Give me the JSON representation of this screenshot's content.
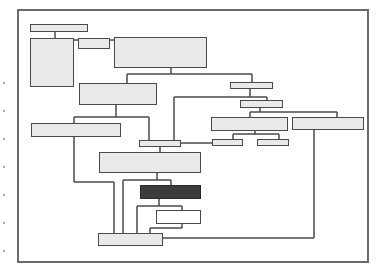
{
  "diagram": {
    "type": "hierarchical-block-diagram",
    "frame": {
      "x": 17,
      "y": 9,
      "w": 352,
      "h": 254,
      "color": "#6a6a6a"
    },
    "colors": {
      "light_fill": "#e9e9e9",
      "dark_fill": "#3c3c3c",
      "white_fill": "#ffffff",
      "stroke": "#4a4a4a"
    },
    "nodes": [
      {
        "id": "A",
        "x": 30,
        "y": 24,
        "w": 58,
        "h": 8,
        "style": "light"
      },
      {
        "id": "B",
        "x": 30,
        "y": 38,
        "w": 44,
        "h": 49,
        "style": "light"
      },
      {
        "id": "C",
        "x": 78,
        "y": 38,
        "w": 32,
        "h": 11,
        "style": "light"
      },
      {
        "id": "D",
        "x": 114,
        "y": 37,
        "w": 93,
        "h": 31,
        "style": "light"
      },
      {
        "id": "E",
        "x": 79,
        "y": 83,
        "w": 78,
        "h": 22,
        "style": "light"
      },
      {
        "id": "F",
        "x": 230,
        "y": 82,
        "w": 43,
        "h": 7,
        "style": "light"
      },
      {
        "id": "G",
        "x": 240,
        "y": 100,
        "w": 43,
        "h": 8,
        "style": "light"
      },
      {
        "id": "H",
        "x": 211,
        "y": 117,
        "w": 77,
        "h": 14,
        "style": "light"
      },
      {
        "id": "I",
        "x": 292,
        "y": 117,
        "w": 72,
        "h": 13,
        "style": "light"
      },
      {
        "id": "J",
        "x": 212,
        "y": 139,
        "w": 31,
        "h": 7,
        "style": "light"
      },
      {
        "id": "K",
        "x": 257,
        "y": 139,
        "w": 32,
        "h": 7,
        "style": "light"
      },
      {
        "id": "L",
        "x": 31,
        "y": 123,
        "w": 90,
        "h": 14,
        "style": "light"
      },
      {
        "id": "M",
        "x": 139,
        "y": 140,
        "w": 42,
        "h": 7,
        "style": "light"
      },
      {
        "id": "N",
        "x": 99,
        "y": 152,
        "w": 102,
        "h": 21,
        "style": "light"
      },
      {
        "id": "O",
        "x": 140,
        "y": 185,
        "w": 61,
        "h": 14,
        "style": "dark"
      },
      {
        "id": "P",
        "x": 156,
        "y": 210,
        "w": 45,
        "h": 14,
        "style": "white"
      },
      {
        "id": "Q",
        "x": 98,
        "y": 233,
        "w": 65,
        "h": 13,
        "style": "light"
      }
    ],
    "connectors": [
      [
        55,
        32,
        55,
        38
      ],
      [
        74,
        40,
        78,
        40
      ],
      [
        110,
        40,
        114,
        40
      ],
      [
        171,
        68,
        171,
        74
      ],
      [
        127,
        74,
        252,
        74
      ],
      [
        127,
        74,
        127,
        83
      ],
      [
        252,
        74,
        252,
        82
      ],
      [
        250,
        89,
        250,
        97
      ],
      [
        174,
        97,
        267,
        97
      ],
      [
        174,
        97,
        174,
        140
      ],
      [
        267,
        97,
        267,
        100
      ],
      [
        260,
        108,
        260,
        112
      ],
      [
        250,
        112,
        337,
        112
      ],
      [
        250,
        112,
        250,
        117
      ],
      [
        337,
        112,
        337,
        117
      ],
      [
        255,
        131,
        255,
        134
      ],
      [
        233,
        134,
        279,
        134
      ],
      [
        233,
        134,
        233,
        139
      ],
      [
        279,
        134,
        279,
        139
      ],
      [
        181,
        143,
        212,
        143
      ],
      [
        116,
        105,
        116,
        117
      ],
      [
        74,
        117,
        149,
        117
      ],
      [
        74,
        117,
        74,
        123
      ],
      [
        149,
        117,
        149,
        140
      ],
      [
        160,
        147,
        160,
        152
      ],
      [
        74,
        137,
        74,
        182
      ],
      [
        74,
        182,
        114,
        182
      ],
      [
        114,
        182,
        114,
        233
      ],
      [
        157,
        173,
        157,
        180
      ],
      [
        123,
        180,
        171,
        180
      ],
      [
        123,
        180,
        123,
        233
      ],
      [
        171,
        180,
        171,
        185
      ],
      [
        159,
        199,
        159,
        206
      ],
      [
        137,
        206,
        182,
        206
      ],
      [
        137,
        206,
        137,
        233
      ],
      [
        182,
        206,
        182,
        210
      ],
      [
        182,
        224,
        182,
        228
      ],
      [
        150,
        228,
        182,
        228
      ],
      [
        150,
        228,
        150,
        233
      ],
      [
        314,
        130,
        314,
        238
      ],
      [
        163,
        238,
        314,
        238
      ]
    ],
    "margin_marks": [
      [
        3,
        82
      ],
      [
        3,
        110
      ],
      [
        3,
        138
      ],
      [
        3,
        166
      ],
      [
        3,
        194
      ],
      [
        3,
        222
      ],
      [
        3,
        250
      ]
    ]
  }
}
